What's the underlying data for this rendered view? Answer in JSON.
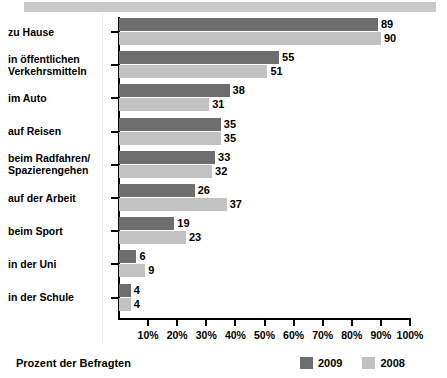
{
  "chart_data": {
    "type": "bar",
    "orientation": "horizontal",
    "title": "",
    "xlabel": "Prozent der Befragten",
    "ylabel": "",
    "xlim": [
      0,
      100
    ],
    "xticks": [
      "10%",
      "20%",
      "30%",
      "40%",
      "50%",
      "60%",
      "70%",
      "80%",
      "90%",
      "100%"
    ],
    "xtick_values": [
      10,
      20,
      30,
      40,
      50,
      60,
      70,
      80,
      90,
      100
    ],
    "grid": false,
    "legend_position": "bottom-right",
    "categories": [
      "zu Hause",
      "in öffentlichen Verkehrsmitteln",
      "im Auto",
      "auf Reisen",
      "beim Radfahren/ Spazierengehen",
      "auf der Arbeit",
      "beim Sport",
      "in der Uni",
      "in der Schule"
    ],
    "category_lines": [
      [
        "zu Hause"
      ],
      [
        "in öffentlichen",
        "Verkehrsmitteln"
      ],
      [
        "im Auto"
      ],
      [
        "auf Reisen"
      ],
      [
        "beim Radfahren/",
        "Spazierengehen"
      ],
      [
        "auf der Arbeit"
      ],
      [
        "beim Sport"
      ],
      [
        "in der Uni"
      ],
      [
        "in der Schule"
      ]
    ],
    "series": [
      {
        "name": "2009",
        "color": "#6e6e6e",
        "values": [
          89,
          55,
          38,
          35,
          33,
          26,
          19,
          6,
          4
        ]
      },
      {
        "name": "2008",
        "color": "#c2c2c2",
        "values": [
          90,
          51,
          31,
          35,
          32,
          37,
          23,
          9,
          4
        ]
      }
    ]
  },
  "legend": {
    "items": [
      {
        "label": "2009",
        "color": "#6e6e6e"
      },
      {
        "label": "2008",
        "color": "#c2c2c2"
      }
    ]
  },
  "caption": {
    "text": "Prozent der Befragten"
  }
}
